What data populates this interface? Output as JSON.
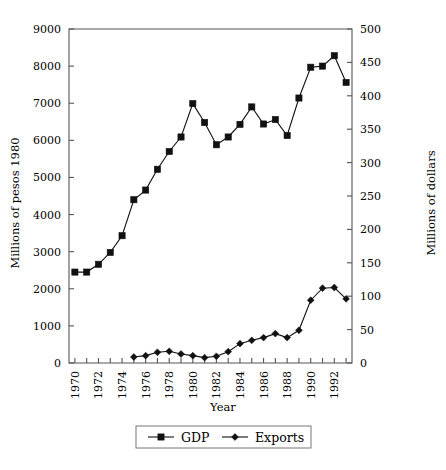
{
  "chart_data": {
    "type": "line",
    "title": "",
    "xlabel": "Year",
    "ylabel": "Millions of pesos 1980",
    "ylabel_right": "Millions of dollars",
    "x": [
      1970,
      1971,
      1972,
      1973,
      1974,
      1975,
      1976,
      1977,
      1978,
      1979,
      1980,
      1981,
      1982,
      1983,
      1984,
      1985,
      1986,
      1987,
      1988,
      1989,
      1990,
      1991,
      1992,
      1993
    ],
    "xlim": [
      1969.5,
      1993.5
    ],
    "xtick_labels": [
      "1970",
      "1972",
      "1974",
      "1976",
      "1978",
      "1980",
      "1982",
      "1984",
      "1986",
      "1988",
      "1990",
      "1992"
    ],
    "xticks_major": [
      1970,
      1972,
      1974,
      1976,
      1978,
      1980,
      1982,
      1984,
      1986,
      1988,
      1990,
      1992
    ],
    "xticks_minor_step": 1,
    "ylim": [
      0,
      9000
    ],
    "ytick_labels": [
      "0",
      "1000",
      "2000",
      "3000",
      "4000",
      "5000",
      "6000",
      "7000",
      "8000",
      "9000"
    ],
    "yticks": [
      0,
      1000,
      2000,
      3000,
      4000,
      5000,
      6000,
      7000,
      8000,
      9000
    ],
    "ylim_right": [
      0,
      500
    ],
    "ytick_labels_right": [
      "0",
      "50",
      "100",
      "150",
      "200",
      "250",
      "300",
      "350",
      "400",
      "450",
      "500"
    ],
    "yticks_right": [
      0,
      50,
      100,
      150,
      200,
      250,
      300,
      350,
      400,
      450,
      500
    ],
    "grid": false,
    "legend_position": "bottom-center",
    "series": [
      {
        "name": "GDP",
        "axis": "left",
        "marker": "square",
        "x": [
          1970,
          1971,
          1972,
          1973,
          1974,
          1975,
          1976,
          1977,
          1978,
          1979,
          1980,
          1981,
          1982,
          1983,
          1984,
          1985,
          1986,
          1987,
          1988,
          1989,
          1990,
          1991,
          1992,
          1993
        ],
        "values": [
          2450,
          2450,
          2660,
          2980,
          3430,
          4400,
          4660,
          5220,
          5700,
          6090,
          6990,
          6480,
          5880,
          6090,
          6430,
          6900,
          6440,
          6560,
          6130,
          7140,
          7970,
          8000,
          8280,
          7560
        ]
      },
      {
        "name": "Exports",
        "axis": "right",
        "marker": "diamond",
        "x": [
          1975,
          1976,
          1977,
          1978,
          1979,
          1980,
          1981,
          1982,
          1983,
          1984,
          1985,
          1986,
          1987,
          1988,
          1989,
          1990,
          1991,
          1992,
          1993
        ],
        "values": [
          9,
          11,
          16,
          17.5,
          13.5,
          11,
          8,
          10,
          17,
          29,
          34,
          38,
          44,
          38,
          49,
          94,
          112,
          113,
          96
        ]
      }
    ],
    "legend_entries": [
      "GDP",
      "Exports"
    ]
  },
  "colors": {
    "line": "#111111",
    "marker": "#111111",
    "axis": "#555555",
    "background": "#ffffff",
    "text": "#000000"
  }
}
